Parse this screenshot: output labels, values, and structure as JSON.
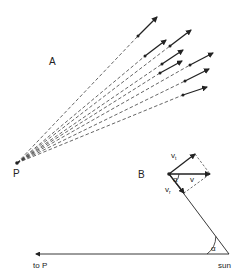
{
  "figure": {
    "panel_a": {
      "label": "A",
      "label_pos": [
        49,
        65
      ],
      "origin": {
        "name": "P",
        "x": 17,
        "y": 163,
        "label": "P",
        "label_pos": [
          13,
          177
        ]
      },
      "arrows": [
        {
          "dot": [
            138,
            36
          ],
          "tip": [
            157,
            17
          ]
        },
        {
          "dot": [
            145,
            56
          ],
          "tip": [
            166,
            40
          ]
        },
        {
          "dot": [
            170,
            46
          ],
          "tip": [
            191,
            30
          ]
        },
        {
          "dot": [
            162,
            64
          ],
          "tip": [
            183,
            50
          ]
        },
        {
          "dot": [
            160,
            73
          ],
          "tip": [
            182,
            61
          ]
        },
        {
          "dot": [
            190,
            65
          ],
          "tip": [
            213,
            53
          ]
        },
        {
          "dot": [
            185,
            81
          ],
          "tip": [
            209,
            69
          ]
        },
        {
          "dot": [
            183,
            95
          ],
          "tip": [
            207,
            87
          ]
        }
      ]
    },
    "panel_b": {
      "label": "B",
      "label_pos": [
        138,
        178
      ],
      "origin": [
        169,
        174
      ],
      "vectors": {
        "v_t": {
          "tip": [
            195,
            154
          ],
          "label": "v",
          "subscript": "t",
          "label_pos": [
            171,
            158
          ]
        },
        "v": {
          "tip": [
            210,
            174
          ],
          "label": "v",
          "label_pos": [
            190,
            182
          ]
        },
        "v_r": {
          "tip": [
            184,
            193
          ],
          "label": "v",
          "subscript": "r",
          "label_pos": [
            165,
            192
          ]
        }
      },
      "angle_label": "α",
      "angle_label_pos": [
        173,
        182
      ]
    },
    "sun_line": {
      "sun": {
        "x": 229,
        "y": 254,
        "label": "sun",
        "label_pos": [
          218,
          268
        ]
      },
      "to_p": {
        "tip": [
          36,
          254
        ],
        "label": "to P",
        "label_pos": [
          33,
          268
        ]
      },
      "angle_label": "α",
      "angle_label_pos": [
        211,
        251
      ]
    }
  },
  "labels": {
    "A": "A",
    "B": "B",
    "P": "P",
    "v": "v",
    "t": "t",
    "r": "r",
    "alpha": "α",
    "sun": "sun",
    "to_p": "to P"
  }
}
